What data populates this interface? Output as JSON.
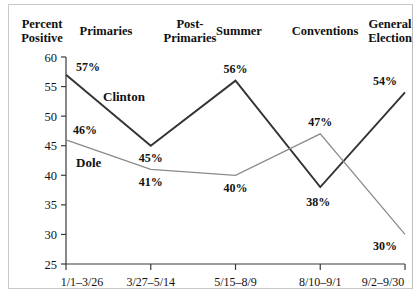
{
  "header": {
    "axis_title": "Percent\nPositive",
    "period_headers": [
      "Primaries",
      "Post-\nPrimaries",
      "Summer",
      "Conventions",
      "General\nElection"
    ]
  },
  "colors": {
    "clinton_line": "#333333",
    "dole_line": "#8a8a8a",
    "axis": "#3a3a3a",
    "text": "#111111",
    "frame": "#c9c9c9",
    "background": "#ffffff"
  },
  "chart_data": {
    "type": "line",
    "title": "",
    "xlabel": "",
    "ylabel": "Percent Positive",
    "categories": [
      "1/1–3/26",
      "3/27–5/14",
      "5/15–8/9",
      "8/10–9/1",
      "9/2–9/30"
    ],
    "period_names": [
      "Primaries",
      "Post-Primaries",
      "Summer",
      "Conventions",
      "General Election"
    ],
    "ylim": [
      25,
      60
    ],
    "yticks": [
      25,
      30,
      35,
      40,
      45,
      50,
      55,
      60
    ],
    "ytick_labels": [
      "25",
      "30",
      "35",
      "40",
      "45",
      "50",
      "55",
      "60"
    ],
    "grid": false,
    "legend": "inline-labels",
    "series": [
      {
        "name": "Clinton",
        "values": [
          57,
          45,
          56,
          38,
          54
        ],
        "data_labels": [
          "57%",
          "45%",
          "56%",
          "38%",
          "54%"
        ],
        "style": "thick-dark"
      },
      {
        "name": "Dole",
        "values": [
          46,
          41,
          40,
          47,
          30
        ],
        "data_labels": [
          "46%",
          "41%",
          "40%",
          "47%",
          "30%"
        ],
        "style": "thin-gray"
      }
    ]
  }
}
